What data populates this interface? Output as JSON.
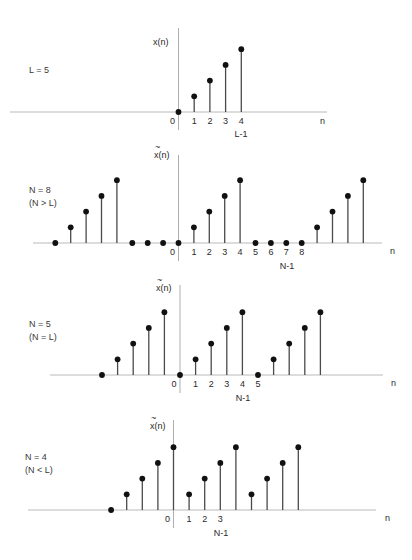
{
  "figure": {
    "panels": [
      {
        "id": "original",
        "side_label": [
          "L = 5"
        ],
        "ylabel": "x(n)",
        "ylabel_tilde": false,
        "xlabel": "n",
        "tick_labels": [
          "0",
          "1",
          "2",
          "3",
          "4"
        ],
        "extra_label": "L-1",
        "n": [
          0,
          1,
          2,
          3,
          4
        ],
        "values": [
          0,
          1,
          2,
          3,
          4
        ]
      },
      {
        "id": "n8",
        "side_label": [
          "N = 8",
          "(N > L)"
        ],
        "ylabel": "x(n)",
        "ylabel_tilde": true,
        "xlabel": "n",
        "tick_labels": [
          "0",
          "1",
          "2",
          "3",
          "4",
          "5",
          "6",
          "7",
          "8"
        ],
        "extra_label": "N-1",
        "n": [
          -8,
          -7,
          -6,
          -5,
          -4,
          -3,
          -2,
          -1,
          0,
          1,
          2,
          3,
          4,
          5,
          6,
          7,
          8,
          9,
          10,
          11,
          12
        ],
        "values": [
          0,
          1,
          2,
          3,
          4,
          0,
          0,
          0,
          0,
          1,
          2,
          3,
          4,
          0,
          0,
          0,
          0,
          1,
          2,
          3,
          4
        ]
      },
      {
        "id": "n5",
        "side_label": [
          "N = 5",
          "(N = L)"
        ],
        "ylabel": "x(n)",
        "ylabel_tilde": true,
        "xlabel": "n",
        "tick_labels": [
          "0",
          "1",
          "2",
          "3",
          "4",
          "5"
        ],
        "extra_label": "N-1",
        "n": [
          -5,
          -4,
          -3,
          -2,
          -1,
          0,
          1,
          2,
          3,
          4,
          5,
          6,
          7,
          8,
          9
        ],
        "values": [
          0,
          1,
          2,
          3,
          4,
          0,
          1,
          2,
          3,
          4,
          0,
          1,
          2,
          3,
          4
        ]
      },
      {
        "id": "n4",
        "side_label": [
          "N = 4",
          "(N < L)"
        ],
        "ylabel": "x(n)",
        "ylabel_tilde": true,
        "xlabel": "n",
        "tick_labels": [
          "0",
          "1",
          "2",
          "3"
        ],
        "extra_label": "N-1",
        "n": [
          -4,
          -3,
          -2,
          -1,
          0,
          1,
          2,
          3,
          4,
          5,
          6,
          7,
          8
        ],
        "values": [
          0,
          1,
          2,
          3,
          4,
          1,
          2,
          3,
          4,
          1,
          2,
          3,
          4
        ]
      }
    ]
  },
  "chart_data": [
    {
      "type": "stem",
      "title": "x(n), L = 5",
      "xlabel": "n",
      "ylabel": "x(n)",
      "x": [
        0,
        1,
        2,
        3,
        4
      ],
      "values": [
        0,
        1,
        2,
        3,
        4
      ],
      "annotations": [
        "L = 5",
        "L-1"
      ],
      "grid": false
    },
    {
      "type": "stem",
      "title": "x~(n), N = 8 (N > L)",
      "xlabel": "n",
      "ylabel": "x~(n)",
      "x": [
        -8,
        -7,
        -6,
        -5,
        -4,
        -3,
        -2,
        -1,
        0,
        1,
        2,
        3,
        4,
        5,
        6,
        7,
        8,
        9,
        10,
        11,
        12
      ],
      "values": [
        0,
        1,
        2,
        3,
        4,
        0,
        0,
        0,
        0,
        1,
        2,
        3,
        4,
        0,
        0,
        0,
        0,
        1,
        2,
        3,
        4
      ],
      "annotations": [
        "N = 8",
        "(N > L)",
        "N-1"
      ],
      "grid": false
    },
    {
      "type": "stem",
      "title": "x~(n), N = 5 (N = L)",
      "xlabel": "n",
      "ylabel": "x~(n)",
      "x": [
        -5,
        -4,
        -3,
        -2,
        -1,
        0,
        1,
        2,
        3,
        4,
        5,
        6,
        7,
        8,
        9
      ],
      "values": [
        0,
        1,
        2,
        3,
        4,
        0,
        1,
        2,
        3,
        4,
        0,
        1,
        2,
        3,
        4
      ],
      "annotations": [
        "N = 5",
        "(N = L)",
        "N-1"
      ],
      "grid": false
    },
    {
      "type": "stem",
      "title": "x~(n), N = 4 (N < L)",
      "xlabel": "n",
      "ylabel": "x~(n)",
      "x": [
        -4,
        -3,
        -2,
        -1,
        0,
        1,
        2,
        3,
        4,
        5,
        6,
        7,
        8
      ],
      "values": [
        0,
        1,
        2,
        3,
        4,
        1,
        2,
        3,
        4,
        1,
        2,
        3,
        4
      ],
      "annotations": [
        "N = 4",
        "(N < L)",
        "N-1"
      ],
      "grid": false
    }
  ]
}
